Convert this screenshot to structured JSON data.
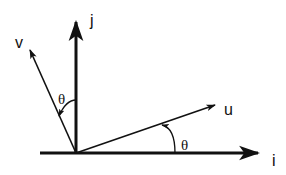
{
  "diagram": {
    "title": "",
    "labels": {
      "i": "i",
      "j": "j",
      "u": "u",
      "v": "v",
      "theta_u": "θ",
      "theta_v": "θ"
    },
    "vectors": [
      {
        "name": "i",
        "description": "horizontal axis unit vector"
      },
      {
        "name": "j",
        "description": "vertical axis unit vector"
      },
      {
        "name": "u",
        "description": "i rotated by θ counterclockwise"
      },
      {
        "name": "v",
        "description": "j rotated by θ counterclockwise"
      }
    ],
    "colors": {
      "stroke": "#111111",
      "background": "#ffffff"
    }
  }
}
